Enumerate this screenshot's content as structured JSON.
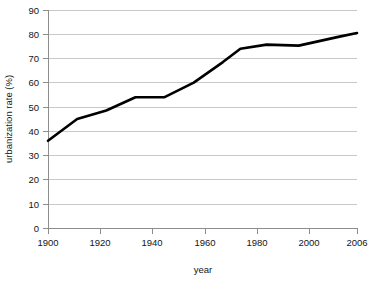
{
  "chart_data": {
    "type": "line",
    "title": "",
    "xlabel": "year",
    "ylabel": "urbanization rate (%)",
    "xlim": [
      1900,
      2006
    ],
    "ylim": [
      0,
      90
    ],
    "grid": "horizontal",
    "legend": "none",
    "y_ticks": [
      0,
      10,
      20,
      30,
      40,
      50,
      60,
      70,
      80,
      90
    ],
    "y_tick_labels": [
      "0",
      "10",
      "20",
      "30",
      "40",
      "50",
      "60",
      "70",
      "80",
      "90"
    ],
    "x_ticks": [
      1900,
      1920,
      1940,
      1960,
      1980,
      2000,
      2006
    ],
    "x_tick_labels": [
      "1900",
      "1920",
      "1940",
      "1960",
      "1980",
      "2000",
      "2006"
    ],
    "series": [
      {
        "name": "urbanization rate",
        "color": "#000000",
        "x": [
          1900,
          1910,
          1920,
          1930,
          1940,
          1950,
          1960,
          1966,
          1975,
          1986,
          2000,
          2006
        ],
        "values": [
          36,
          45,
          48.5,
          54,
          54,
          60,
          68.5,
          74,
          75.7,
          75.3,
          79,
          80.5
        ]
      }
    ]
  }
}
